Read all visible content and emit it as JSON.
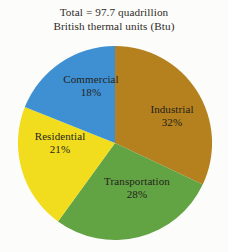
{
  "title": {
    "line1": "Total = 97.7 quadrillion",
    "line2": "British thermal units (Btu)"
  },
  "colors": {
    "background": "#fcfcfa",
    "text": "#241f1b",
    "industrial": "#b5811f",
    "transportation": "#62a344",
    "residential": "#f2dc1e",
    "commercial": "#3e90d2"
  },
  "chart_data": {
    "type": "pie",
    "title": "Total = 97.7 quadrillion British thermal units (Btu)",
    "total": 97.7,
    "units": "quadrillion Btu",
    "start_angle": 0,
    "direction": "clockwise",
    "legend": "none (labels inside slices)",
    "categories": [
      "Industrial",
      "Transportation",
      "Residential",
      "Commercial"
    ],
    "values": [
      32,
      28,
      21,
      18
    ],
    "value_suffix": "%",
    "slices": [
      {
        "label": "Industrial",
        "percent": 32,
        "percent_text": "32%",
        "color": "#b5811f",
        "label_x": 172,
        "label_y": 113
      },
      {
        "label": "Transportation",
        "percent": 28,
        "percent_text": "28%",
        "color": "#62a344",
        "label_x": 137,
        "label_y": 185
      },
      {
        "label": "Residential",
        "percent": 21,
        "percent_text": "21%",
        "color": "#f2dc1e",
        "label_x": 60,
        "label_y": 140
      },
      {
        "label": "Commercial",
        "percent": 18,
        "percent_text": "18%",
        "color": "#3e90d2",
        "label_x": 91,
        "label_y": 83
      }
    ]
  }
}
